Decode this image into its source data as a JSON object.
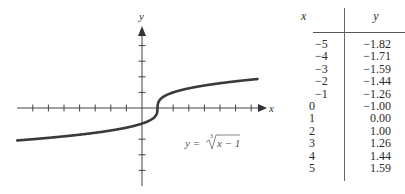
{
  "chart_data": {
    "type": "line",
    "title": "",
    "equation_label": "y = ∛(x−1)",
    "xlabel": "x",
    "ylabel": "y",
    "grid": false,
    "axis_ranges": {
      "x": [
        -8,
        8
      ],
      "y": [
        -5,
        5
      ]
    },
    "x_ticks": [
      -7,
      -6,
      -5,
      -4,
      -3,
      -2,
      -1,
      1,
      2,
      3,
      4,
      5,
      6,
      7
    ],
    "y_ticks": [
      -4,
      -3,
      -2,
      1,
      2,
      3,
      4
    ],
    "curve": {
      "function": "cbrt(x-1)",
      "x_range": [
        -8,
        7.4
      ],
      "color": "#3a3a3a"
    },
    "table": {
      "columns": [
        "x",
        "y"
      ],
      "x": [
        -5,
        -4,
        -3,
        -2,
        -1,
        0,
        1,
        2,
        3,
        4,
        5
      ],
      "y": [
        -1.82,
        -1.71,
        -1.59,
        -1.44,
        -1.26,
        -1.0,
        0.0,
        1.0,
        1.26,
        1.44,
        1.59
      ]
    }
  },
  "plot": {
    "x_axis_label": "x",
    "y_axis_label": "y",
    "equation": {
      "lhs": "y =",
      "index": "3",
      "radicand": "x − 1"
    }
  },
  "table": {
    "header": {
      "x": "x",
      "y": "y"
    },
    "rows": [
      {
        "x": "−5",
        "y": "−1.82"
      },
      {
        "x": "−4",
        "y": "−1.71"
      },
      {
        "x": "−3",
        "y": "−1.59"
      },
      {
        "x": "−2",
        "y": "−1.44"
      },
      {
        "x": "−1",
        "y": "−1.26"
      },
      {
        "x": "0",
        "y": "−1.00"
      },
      {
        "x": "1",
        "y": "0.00"
      },
      {
        "x": "2",
        "y": "1.00"
      },
      {
        "x": "3",
        "y": "1.26"
      },
      {
        "x": "4",
        "y": "1.44"
      },
      {
        "x": "5",
        "y": "1.59"
      }
    ]
  }
}
